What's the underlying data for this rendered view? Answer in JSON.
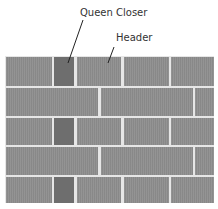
{
  "labels": {
    "queen_closer": "Queen Closer",
    "header": "Header"
  },
  "colors": {
    "brick": "#8e8e8e",
    "queen_closer": "#6e6e6e",
    "mortar": "#e6e6e6",
    "leader_line": "#222222"
  },
  "wall": {
    "courses": [
      {
        "type": "header_course",
        "bricks": [
          "header",
          "queen_closer",
          "header",
          "header",
          "header"
        ]
      },
      {
        "type": "stretcher_course",
        "bricks": [
          "stretcher",
          "stretcher",
          "stretcher_partial"
        ]
      },
      {
        "type": "header_course",
        "bricks": [
          "header",
          "queen_closer",
          "header",
          "header",
          "header"
        ]
      },
      {
        "type": "stretcher_course",
        "bricks": [
          "stretcher",
          "stretcher",
          "stretcher_partial"
        ]
      },
      {
        "type": "header_course",
        "bricks": [
          "header",
          "queen_closer",
          "header",
          "header",
          "header"
        ]
      }
    ]
  }
}
